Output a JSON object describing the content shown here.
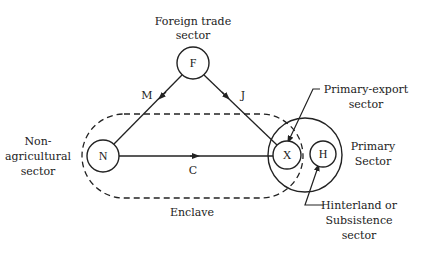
{
  "diagram": {
    "nodes": {
      "F": {
        "letter": "F",
        "label": [
          "Foreign trade",
          "sector"
        ]
      },
      "N": {
        "letter": "N",
        "label": [
          "Non-",
          "agricultural",
          "sector"
        ]
      },
      "X": {
        "letter": "X",
        "label": [
          "Primary-export",
          "sector"
        ]
      },
      "H": {
        "letter": "H",
        "label": [
          "Hinterland or",
          "Subsistence",
          "sector"
        ]
      }
    },
    "edges": {
      "M": {
        "label": "M",
        "from": "F",
        "to": "N"
      },
      "J": {
        "label": "J",
        "from": "F",
        "to": "X"
      },
      "C": {
        "label": "C",
        "from": "N",
        "to": "X"
      }
    },
    "regions": {
      "enclave": {
        "label": "Enclave"
      },
      "primary": {
        "label": [
          "Primary",
          "Sector"
        ]
      }
    },
    "colors": {
      "ink": "#222222",
      "background": "#ffffff"
    }
  }
}
